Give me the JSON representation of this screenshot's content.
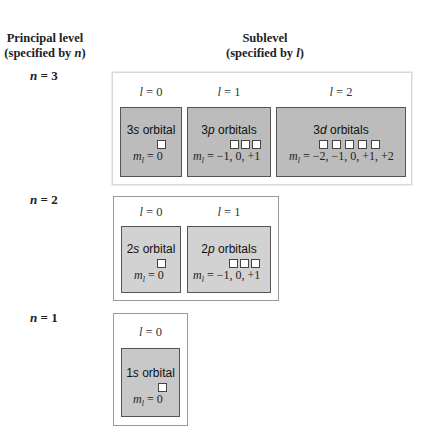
{
  "headers": {
    "principal_title": "Principal level",
    "principal_sub_prefix": "(specified by ",
    "principal_sub_var": "n",
    "principal_sub_suffix": ")",
    "sublevel_title": "Sublevel",
    "sublevel_sub_prefix": "(specified by ",
    "sublevel_sub_var": "l",
    "sublevel_sub_suffix": ")"
  },
  "levels": [
    {
      "n_var": "n",
      "n_eq": " = 3",
      "sublevels": [
        {
          "l_var": "l",
          "l_eq": " = 0",
          "prefix": "3",
          "letter": "s",
          "suffix": " orbital",
          "boxes": 1,
          "ml_var": "m",
          "ml_sub": "l",
          "ml_values": " = 0"
        },
        {
          "l_var": "l",
          "l_eq": " = 1",
          "prefix": "3",
          "letter": "p",
          "suffix": " orbitals",
          "boxes": 3,
          "ml_var": "m",
          "ml_sub": "l",
          "ml_values": " = −1, 0, +1"
        },
        {
          "l_var": "l",
          "l_eq": " = 2",
          "prefix": "3",
          "letter": "d",
          "suffix": " orbitals",
          "boxes": 5,
          "ml_var": "m",
          "ml_sub": "l",
          "ml_values": " = −2, −1, 0, +1, +2"
        }
      ]
    },
    {
      "n_var": "n",
      "n_eq": " = 2",
      "sublevels": [
        {
          "l_var": "l",
          "l_eq": " = 0",
          "prefix": "2",
          "letter": "s",
          "suffix": " orbital",
          "boxes": 1,
          "ml_var": "m",
          "ml_sub": "l",
          "ml_values": " = 0"
        },
        {
          "l_var": "l",
          "l_eq": " = 1",
          "prefix": "2",
          "letter": "p",
          "suffix": " orbitals",
          "boxes": 3,
          "ml_var": "m",
          "ml_sub": "l",
          "ml_values": " = −1, 0, +1"
        }
      ]
    },
    {
      "n_var": "n",
      "n_eq": " = 1",
      "sublevels": [
        {
          "l_var": "l",
          "l_eq": " = 0",
          "prefix": "1",
          "letter": "s",
          "suffix": " orbital",
          "boxes": 1,
          "ml_var": "m",
          "ml_sub": "l",
          "ml_values": " = 0"
        }
      ]
    }
  ],
  "colors": {
    "n3_fill": "#bcbcbc",
    "n2_fill": "#d2d2d2",
    "n1_fill": "#c8c8c8",
    "orbital_square": "#ffffff",
    "border": "#555555"
  }
}
